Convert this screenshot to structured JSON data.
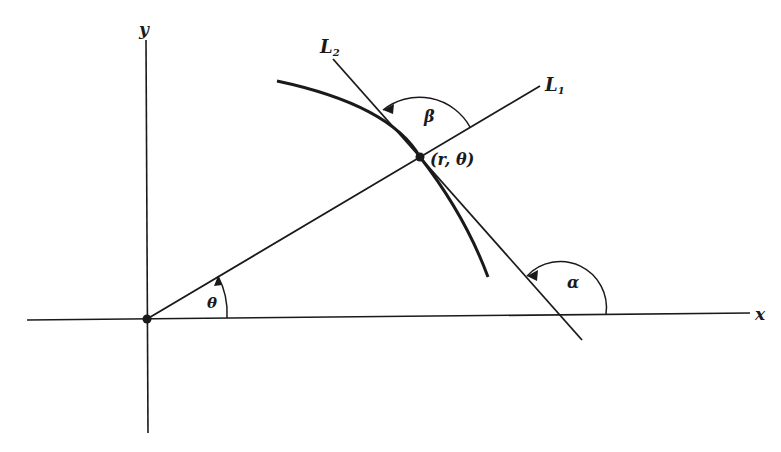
{
  "diagram": {
    "type": "polar-coordinate tangent geometry",
    "colors": {
      "ink": "#1a1a1a",
      "background": "#ffffff"
    },
    "axes": {
      "x_label": "x",
      "y_label": "y"
    },
    "lines": {
      "L1_label": "L",
      "L1_subscript": "1",
      "L2_label": "L",
      "L2_subscript": "2"
    },
    "point": {
      "label": "(r, θ)",
      "origin_dot": true
    },
    "angles": {
      "theta": "θ",
      "beta": "β",
      "alpha": "α"
    }
  }
}
